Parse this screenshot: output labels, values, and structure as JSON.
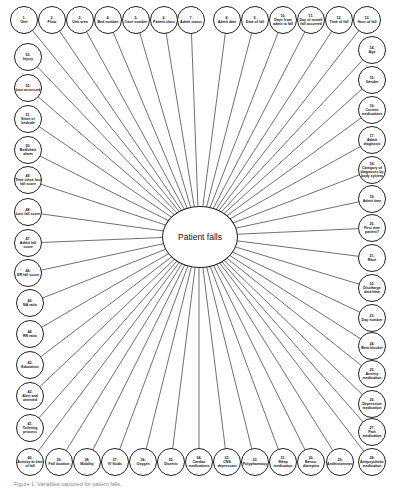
{
  "diagram": {
    "center_label": "Patient falls",
    "caption": "Figure 1. Variables captured for patient falls.",
    "center": {
      "x": 199,
      "y": 236
    },
    "nodes": [
      {
        "num": "1.",
        "label": "Unit",
        "x": 24,
        "y": 20
      },
      {
        "num": "2.",
        "label": "Floor",
        "x": 52,
        "y": 20
      },
      {
        "num": "3.",
        "label": "Unit area",
        "x": 80,
        "y": 20
      },
      {
        "num": "4.",
        "label": "Bed number",
        "x": 108,
        "y": 20
      },
      {
        "num": "5.",
        "label": "Case number",
        "x": 136,
        "y": 20
      },
      {
        "num": "6.",
        "label": "Patient class",
        "x": 164,
        "y": 20
      },
      {
        "num": "7.",
        "label": "Admit status",
        "x": 191,
        "y": 20
      },
      {
        "num": "8.",
        "label": "Admit date",
        "x": 227,
        "y": 20
      },
      {
        "num": "9.",
        "label": "Date of fall",
        "x": 255,
        "y": 20
      },
      {
        "num": "10.",
        "label": "Days from admit to fall",
        "x": 283,
        "y": 20
      },
      {
        "num": "11.",
        "label": "Day of month fall occurred",
        "x": 311,
        "y": 20
      },
      {
        "num": "12.",
        "label": "Time of fall",
        "x": 339,
        "y": 20
      },
      {
        "num": "13.",
        "label": "Hour of fall",
        "x": 367,
        "y": 20
      },
      {
        "num": "14.",
        "label": "Age",
        "x": 372,
        "y": 50
      },
      {
        "num": "15.",
        "label": "Gender",
        "x": 372,
        "y": 80
      },
      {
        "num": "16.",
        "label": "Current medications",
        "x": 372,
        "y": 110
      },
      {
        "num": "17.",
        "label": "Admit diagnosis",
        "x": 372,
        "y": 140
      },
      {
        "num": "18.",
        "label": "Category of diagnoses by body system",
        "x": 372,
        "y": 170
      },
      {
        "num": "19.",
        "label": "Admit time",
        "x": 372,
        "y": 199
      },
      {
        "num": "20.",
        "label": "First time patient?",
        "x": 372,
        "y": 228
      },
      {
        "num": "21.",
        "label": "Race",
        "x": 372,
        "y": 258
      },
      {
        "num": "22.",
        "label": "Discharge date/time",
        "x": 372,
        "y": 288
      },
      {
        "num": "23.",
        "label": "Day number",
        "x": 372,
        "y": 318
      },
      {
        "num": "24.",
        "label": "Beta blocker",
        "x": 372,
        "y": 346
      },
      {
        "num": "25.",
        "label": "Anxiety medication",
        "x": 372,
        "y": 374
      },
      {
        "num": "26.",
        "label": "Depression medication",
        "x": 372,
        "y": 404
      },
      {
        "num": "27.",
        "label": "Pain medication",
        "x": 372,
        "y": 432
      },
      {
        "num": "28.",
        "label": "Antipsychotic medication",
        "x": 372,
        "y": 462
      },
      {
        "num": "29.",
        "label": "Antihistamines",
        "x": 340,
        "y": 462
      },
      {
        "num": "30.",
        "label": "Benzo-diazepine",
        "x": 311,
        "y": 462
      },
      {
        "num": "31.",
        "label": "Sleep medication",
        "x": 283,
        "y": 462
      },
      {
        "num": "32.",
        "label": "Polypharmacy",
        "x": 255,
        "y": 462
      },
      {
        "num": "33.",
        "label": "CNS depressant",
        "x": 227,
        "y": 462
      },
      {
        "num": "34.",
        "label": "Cardiac medications",
        "x": 199,
        "y": 462
      },
      {
        "num": "35.",
        "label": "Diuretic",
        "x": 171,
        "y": 462
      },
      {
        "num": "36.",
        "label": "Oxygen",
        "x": 143,
        "y": 462
      },
      {
        "num": "37.",
        "label": "IV fluids",
        "x": 115,
        "y": 462
      },
      {
        "num": "38.",
        "label": "Mobility",
        "x": 87,
        "y": 462
      },
      {
        "num": "39.",
        "label": "Fall location",
        "x": 59,
        "y": 462
      },
      {
        "num": "40.",
        "label": "Activity at time of fall",
        "x": 30,
        "y": 462
      },
      {
        "num": "41.",
        "label": "Toileting process",
        "x": 30,
        "y": 428
      },
      {
        "num": "42.",
        "label": "Alert and oriented",
        "x": 30,
        "y": 396
      },
      {
        "num": "43.",
        "label": "Education",
        "x": 30,
        "y": 365
      },
      {
        "num": "44.",
        "label": "RN ratio",
        "x": 30,
        "y": 334
      },
      {
        "num": "45.",
        "label": "NA ratio",
        "x": 30,
        "y": 303
      },
      {
        "num": "46.",
        "label": "ER fall score",
        "x": 28,
        "y": 273
      },
      {
        "num": "47.",
        "label": "Admit fall score",
        "x": 28,
        "y": 243
      },
      {
        "num": "48.",
        "label": "Last fall score",
        "x": 28,
        "y": 212
      },
      {
        "num": "49.",
        "label": "Time since last fall score",
        "x": 28,
        "y": 180
      },
      {
        "num": "50.",
        "label": "Bed/chair alarm",
        "x": 28,
        "y": 150
      },
      {
        "num": "51.",
        "label": "Sitter or bedside",
        "x": 28,
        "y": 119
      },
      {
        "num": "52.",
        "label": "Last assessed",
        "x": 28,
        "y": 88
      },
      {
        "num": "53.",
        "label": "Injury",
        "x": 28,
        "y": 57
      }
    ]
  }
}
